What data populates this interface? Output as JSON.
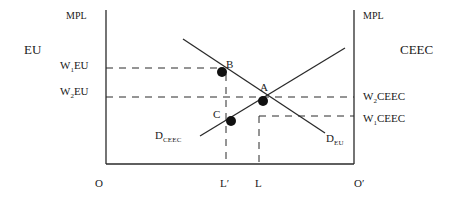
{
  "diagram": {
    "type": "labour-market-two-region",
    "left_region_label": "EU",
    "right_region_label": "CEEC",
    "left_axis": {
      "title": "MPL",
      "ticks": [
        {
          "main": "W",
          "sub": "1",
          "rest": "EU"
        },
        {
          "main": "W",
          "sub": "2",
          "rest": "EU"
        }
      ]
    },
    "right_axis": {
      "title": "MPL",
      "ticks": [
        {
          "main": "W",
          "sub": "2",
          "rest": "CEEC"
        },
        {
          "main": "W",
          "sub": "1",
          "rest": "CEEC"
        }
      ]
    },
    "bottom_axis": {
      "origin_left": "O",
      "origin_right": "O′",
      "ticks": [
        "L′",
        "L"
      ]
    },
    "curves": [
      {
        "name": "D",
        "sub": "EU",
        "slope": "downward"
      },
      {
        "name": "D",
        "sub": "CEEC",
        "slope": "upward"
      }
    ],
    "points": [
      {
        "label": "A",
        "desc": "intersection of D_EU and D_CEEC at W2"
      },
      {
        "label": "B",
        "desc": "D_EU at L′, wage W1EU"
      },
      {
        "label": "C",
        "desc": "D_CEEC at L′, wage W1CEEC"
      }
    ],
    "colors": {
      "line": "#2a2a2a",
      "text": "#1a1a1a",
      "background": "#ffffff"
    }
  }
}
